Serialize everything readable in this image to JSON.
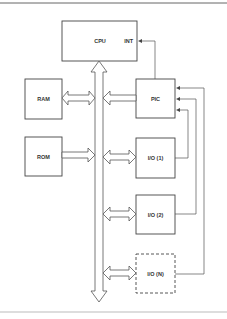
{
  "diagram": {
    "type": "block-diagram",
    "title": "",
    "colors": {
      "line": "#555555",
      "text": "#333333",
      "rule": "#777777",
      "background": "#ffffff"
    },
    "blocks": {
      "cpu": {
        "label": "CPU",
        "port_label": "INT"
      },
      "ram": {
        "label": "RAM"
      },
      "rom": {
        "label": "ROM"
      },
      "pic": {
        "label": "PIC"
      },
      "io1": {
        "label": "I/O (1)"
      },
      "io2": {
        "label": "I/O (2)"
      },
      "ion": {
        "label": "I/O (N)",
        "style": "dashed"
      }
    },
    "connections": [
      {
        "from": "bus",
        "to": "cpu",
        "type": "bus-arrow"
      },
      {
        "from": "ram",
        "to": "bus",
        "type": "bidirectional-bus-arrow"
      },
      {
        "from": "pic",
        "to": "bus",
        "type": "bus-arrow"
      },
      {
        "from": "rom",
        "to": "bus",
        "type": "bus-arrow"
      },
      {
        "from": "io1",
        "to": "bus",
        "type": "bidirectional-bus-arrow"
      },
      {
        "from": "io2",
        "to": "bus",
        "type": "bidirectional-bus-arrow"
      },
      {
        "from": "ion",
        "to": "bus",
        "type": "bidirectional-bus-arrow"
      },
      {
        "from": "pic",
        "to": "cpu.INT",
        "type": "signal-line"
      },
      {
        "from": "io1",
        "to": "pic",
        "type": "signal-line"
      },
      {
        "from": "io2",
        "to": "pic",
        "type": "signal-line"
      },
      {
        "from": "ion",
        "to": "pic",
        "type": "signal-line"
      }
    ]
  }
}
